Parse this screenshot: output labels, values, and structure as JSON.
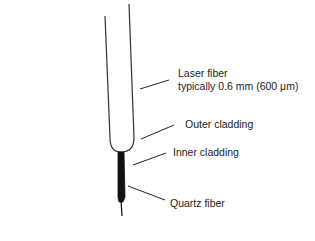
{
  "diagram": {
    "labels": {
      "laser_fiber": "Laser fiber",
      "laser_fiber_size": "typically 0.6 mm (600 μm)",
      "outer_cladding": "Outer cladding",
      "inner_cladding": "Inner cladding",
      "quartz_fiber": "Quartz fiber"
    },
    "colors": {
      "stroke": "#222222",
      "fill_core": "#111111",
      "background": "#ffffff"
    }
  }
}
